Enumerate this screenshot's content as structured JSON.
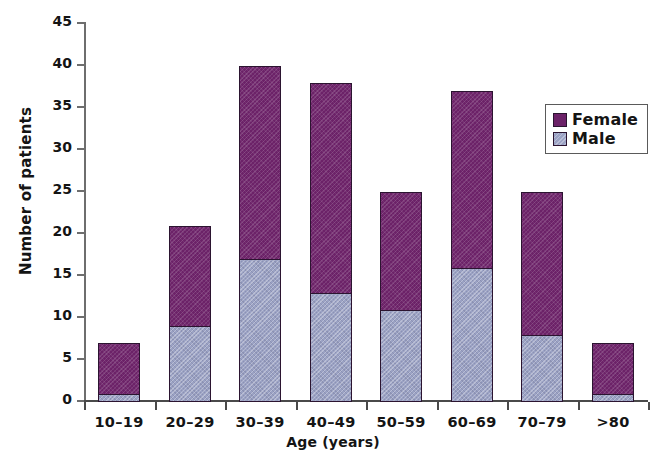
{
  "chart_data": {
    "type": "bar",
    "subtype": "stacked-vertical",
    "title": "",
    "xlabel": "Age (years)",
    "ylabel": "Number of patients",
    "categories": [
      "10–19",
      "20–29",
      "30–39",
      "40–49",
      "50–59",
      "60–69",
      "70–79",
      ">80"
    ],
    "series": [
      {
        "name": "Male",
        "color": "#9ba2c4",
        "values": [
          1,
          9,
          17,
          13,
          11,
          16,
          8,
          1
        ]
      },
      {
        "name": "Female",
        "color": "#6c2268",
        "values": [
          6,
          12,
          23,
          25,
          14,
          21,
          17,
          6
        ]
      }
    ],
    "totals": [
      7,
      21,
      40,
      38,
      25,
      37,
      25,
      7
    ],
    "ylim": [
      0,
      45
    ],
    "yticks": [
      0,
      5,
      10,
      15,
      20,
      25,
      30,
      35,
      40,
      45
    ],
    "ytick_labels": [
      "0",
      "5",
      "10",
      "15",
      "20",
      "25",
      "30",
      "35",
      "40",
      "45"
    ],
    "grid": false,
    "legend_position": "top-right",
    "stack_order": [
      "Male",
      "Female"
    ]
  },
  "legend": {
    "entries": [
      {
        "label": "Female",
        "color": "#6c2268"
      },
      {
        "label": "Male",
        "color": "#9ba2c4"
      }
    ]
  },
  "colors": {
    "female": "#6c2268",
    "male": "#9ba2c4",
    "axis": "#4a4a4a",
    "text": "#141414",
    "background": "#ffffff"
  }
}
